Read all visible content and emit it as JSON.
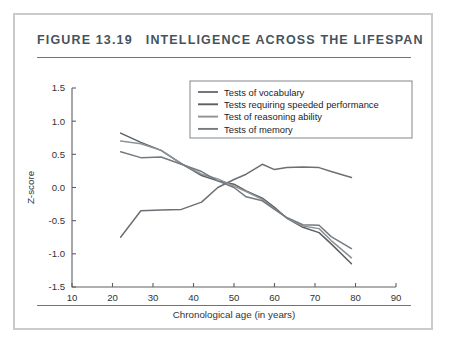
{
  "figure": {
    "number": "FIGURE 13.19",
    "title": "INTELLIGENCE ACROSS THE LIFESPAN",
    "title_color": "#46535c",
    "frame_color": "#c9cacb",
    "rule_color": "#6f7478"
  },
  "chart_data": {
    "type": "line",
    "title": "INTELLIGENCE ACROSS THE LIFESPAN",
    "xlabel": "Chronological age (in years)",
    "ylabel": "Z-score",
    "xlim": [
      10,
      90
    ],
    "ylim": [
      -1.5,
      1.5
    ],
    "xticks": [
      10,
      20,
      30,
      40,
      50,
      60,
      70,
      80,
      90
    ],
    "yticks": [
      1.5,
      1.0,
      0.5,
      0.0,
      -0.5,
      -1.0,
      -1.5
    ],
    "xtick_labels": [
      "10",
      "20",
      "30",
      "40",
      "50",
      "60",
      "70",
      "80",
      "90"
    ],
    "ytick_labels": [
      "1.5",
      "1.0",
      "0.5",
      "0.0",
      "-0.5",
      "-1.0",
      "-1.5"
    ],
    "grid": false,
    "legend_position": "upper right",
    "series": [
      {
        "name": "Tests of vocabulary",
        "color": "#6b7075",
        "x": [
          22,
          27,
          32,
          37,
          42,
          46,
          50,
          53,
          57,
          60,
          63,
          67,
          71,
          74,
          79
        ],
        "y": [
          -0.75,
          -0.35,
          -0.34,
          -0.33,
          -0.22,
          0.0,
          0.12,
          0.2,
          0.35,
          0.27,
          0.3,
          0.31,
          0.3,
          0.24,
          0.15
        ]
      },
      {
        "name": "Tests requiring speeded performance",
        "color": "#5a6064",
        "x": [
          22,
          27,
          32,
          37,
          42,
          46,
          50,
          53,
          57,
          60,
          63,
          67,
          71,
          74,
          79
        ],
        "y": [
          0.82,
          0.68,
          0.56,
          0.36,
          0.18,
          0.1,
          0.05,
          -0.05,
          -0.16,
          -0.3,
          -0.46,
          -0.6,
          -0.68,
          -0.85,
          -1.15
        ]
      },
      {
        "name": "Test of reasoning ability",
        "color": "#8d9296",
        "x": [
          22,
          27,
          32,
          37,
          42,
          46,
          50,
          53,
          57,
          60,
          63,
          67,
          71,
          74,
          79
        ],
        "y": [
          0.7,
          0.66,
          0.56,
          0.36,
          0.2,
          0.13,
          0.02,
          -0.06,
          -0.18,
          -0.32,
          -0.46,
          -0.58,
          -0.62,
          -0.8,
          -1.06
        ]
      },
      {
        "name": "Tests of memory",
        "color": "#737a80",
        "x": [
          22,
          27,
          32,
          37,
          42,
          46,
          50,
          53,
          57,
          60,
          63,
          67,
          71,
          74,
          79
        ],
        "y": [
          0.54,
          0.45,
          0.46,
          0.35,
          0.24,
          0.1,
          0.0,
          -0.14,
          -0.2,
          -0.33,
          -0.45,
          -0.56,
          -0.57,
          -0.74,
          -0.92
        ]
      }
    ]
  }
}
